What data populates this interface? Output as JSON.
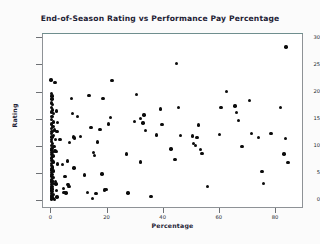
{
  "chart_data": {
    "type": "scatter",
    "title": "End-of-Season Rating vs Performance Pay Percentage",
    "xlabel": "Percentage",
    "ylabel": "Rating",
    "xlim": [
      -3,
      90
    ],
    "ylim": [
      -1.5,
      30.8
    ],
    "xticks": [
      0,
      20,
      40,
      60,
      80
    ],
    "yticks": [
      0,
      5,
      10,
      15,
      20,
      25,
      30
    ],
    "grid": false,
    "legend": null,
    "marker": {
      "shape": "circle",
      "color": "#0b0b0b",
      "size": 3.4
    },
    "frame_color": "#8e9296",
    "plot_background": "#ffffff",
    "page_background": "#fbfbfb",
    "points": [
      [
        0.2,
        22.1
      ],
      [
        1.6,
        21.7
      ],
      [
        0.4,
        19.6
      ],
      [
        0.6,
        19.2
      ],
      [
        0.5,
        18.6
      ],
      [
        0.3,
        17.9
      ],
      [
        0.8,
        17.6
      ],
      [
        0.4,
        17.1
      ],
      [
        0.7,
        16.6
      ],
      [
        0.3,
        16.2
      ],
      [
        1.2,
        15.9
      ],
      [
        0.5,
        15.4
      ],
      [
        0.4,
        14.8
      ],
      [
        1.1,
        14.4
      ],
      [
        0.3,
        14.0
      ],
      [
        0.9,
        13.6
      ],
      [
        0.4,
        13.2
      ],
      [
        1.4,
        12.9
      ],
      [
        0.6,
        12.6
      ],
      [
        0.3,
        12.2
      ],
      [
        1.0,
        11.9
      ],
      [
        0.5,
        11.6
      ],
      [
        0.4,
        11.2
      ],
      [
        1.8,
        11.1
      ],
      [
        0.3,
        10.8
      ],
      [
        0.7,
        10.4
      ],
      [
        0.4,
        10.0
      ],
      [
        1.3,
        9.8
      ],
      [
        0.5,
        9.5
      ],
      [
        0.3,
        9.2
      ],
      [
        1.6,
        9.0
      ],
      [
        0.6,
        8.7
      ],
      [
        0.4,
        8.4
      ],
      [
        0.9,
        8.1
      ],
      [
        0.3,
        7.7
      ],
      [
        0.5,
        7.3
      ],
      [
        1.1,
        7.0
      ],
      [
        0.4,
        6.7
      ],
      [
        0.3,
        6.4
      ],
      [
        0.8,
        6.1
      ],
      [
        0.5,
        5.8
      ],
      [
        0.3,
        5.5
      ],
      [
        1.2,
        5.3
      ],
      [
        0.4,
        5.0
      ],
      [
        0.6,
        4.7
      ],
      [
        0.3,
        4.4
      ],
      [
        0.9,
        4.1
      ],
      [
        0.4,
        3.8
      ],
      [
        0.5,
        3.5
      ],
      [
        0.3,
        3.2
      ],
      [
        1.0,
        3.0
      ],
      [
        0.4,
        2.8
      ],
      [
        0.6,
        2.5
      ],
      [
        0.3,
        2.2
      ],
      [
        0.8,
        2.0
      ],
      [
        0.4,
        1.8
      ],
      [
        0.5,
        1.5
      ],
      [
        0.3,
        1.2
      ],
      [
        1.1,
        1.0
      ],
      [
        0.4,
        0.8
      ],
      [
        0.6,
        0.6
      ],
      [
        0.3,
        0.4
      ],
      [
        0.9,
        0.3
      ],
      [
        0.4,
        0.15
      ],
      [
        1.4,
        0.1
      ],
      [
        2.0,
        2.9
      ],
      [
        2.2,
        1.7
      ],
      [
        2.4,
        0.5
      ],
      [
        2.1,
        8.9
      ],
      [
        2.3,
        12.6
      ],
      [
        2.6,
        14.3
      ],
      [
        2.2,
        16.4
      ],
      [
        1.9,
        3.4
      ],
      [
        2.5,
        6.6
      ],
      [
        3.4,
        11.1
      ],
      [
        4.2,
        6.5
      ],
      [
        4.6,
        2.1
      ],
      [
        4.9,
        1.4
      ],
      [
        5.5,
        1.3
      ],
      [
        5.2,
        4.3
      ],
      [
        6.0,
        7.2
      ],
      [
        6.2,
        2.8
      ],
      [
        6.6,
        2.5
      ],
      [
        6.8,
        10.6
      ],
      [
        7.4,
        18.7
      ],
      [
        7.8,
        16.0
      ],
      [
        8.2,
        11.6
      ],
      [
        8.6,
        11.4
      ],
      [
        8.4,
        5.9
      ],
      [
        9.6,
        15.4
      ],
      [
        10.8,
        11.7
      ],
      [
        12.2,
        4.6
      ],
      [
        13.2,
        1.4
      ],
      [
        13.8,
        19.3
      ],
      [
        14.4,
        13.4
      ],
      [
        15.0,
        0.3
      ],
      [
        15.6,
        8.2
      ],
      [
        15.4,
        8.8
      ],
      [
        16.2,
        1.2
      ],
      [
        16.8,
        10.7
      ],
      [
        17.6,
        13.0
      ],
      [
        18.4,
        4.8
      ],
      [
        18.8,
        18.7
      ],
      [
        19.2,
        1.8
      ],
      [
        19.8,
        1.9
      ],
      [
        20.6,
        14.0
      ],
      [
        21.4,
        15.2
      ],
      [
        22.0,
        22.0
      ],
      [
        27.0,
        8.5
      ],
      [
        27.6,
        1.3
      ],
      [
        30.0,
        14.5
      ],
      [
        30.6,
        19.5
      ],
      [
        32.2,
        15.0
      ],
      [
        32.0,
        7.0
      ],
      [
        33.4,
        15.7
      ],
      [
        33.0,
        14.2
      ],
      [
        33.8,
        12.8
      ],
      [
        35.8,
        0.6
      ],
      [
        37.8,
        12.0
      ],
      [
        39.2,
        16.8
      ],
      [
        39.8,
        13.9
      ],
      [
        43.0,
        9.4
      ],
      [
        44.4,
        7.5
      ],
      [
        45.0,
        25.2
      ],
      [
        45.6,
        17.1
      ],
      [
        46.4,
        11.9
      ],
      [
        50.6,
        11.8
      ],
      [
        51.0,
        10.4
      ],
      [
        51.6,
        10.0
      ],
      [
        52.2,
        11.5
      ],
      [
        52.8,
        13.8
      ],
      [
        53.4,
        9.3
      ],
      [
        54.0,
        8.6
      ],
      [
        56.0,
        2.5
      ],
      [
        60.2,
        12.1
      ],
      [
        60.8,
        17.1
      ],
      [
        62.8,
        20.0
      ],
      [
        65.8,
        17.3
      ],
      [
        66.4,
        16.1
      ],
      [
        67.0,
        14.6
      ],
      [
        68.2,
        9.9
      ],
      [
        71.0,
        18.3
      ],
      [
        71.6,
        12.3
      ],
      [
        74.2,
        11.5
      ],
      [
        75.4,
        5.2
      ],
      [
        76.0,
        3.0
      ],
      [
        78.6,
        12.3
      ],
      [
        82.0,
        17.1
      ],
      [
        83.2,
        8.5
      ],
      [
        83.8,
        11.3
      ],
      [
        84.0,
        28.2
      ],
      [
        84.6,
        6.9
      ]
    ]
  }
}
